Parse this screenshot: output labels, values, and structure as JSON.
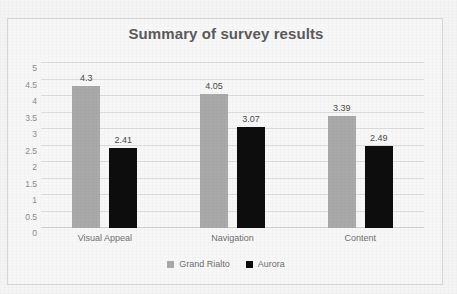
{
  "chart_data": {
    "type": "bar",
    "title": "Summary of survey results",
    "categories": [
      "Visual Appeal",
      "Navigation",
      "Content"
    ],
    "series": [
      {
        "name": "Grand Rialto",
        "color": "#a9a9a9",
        "values": [
          4.3,
          4.05,
          3.39
        ],
        "labels": [
          "4.3",
          "4.05",
          "3.39"
        ]
      },
      {
        "name": "Aurora",
        "color": "#0d0d0d",
        "values": [
          2.41,
          3.07,
          2.49
        ],
        "labels": [
          "2.41",
          "3.07",
          "2.49"
        ]
      }
    ],
    "xlabel": "",
    "ylabel": "",
    "ylim": [
      0,
      5
    ],
    "ytick_values": [
      0,
      0.5,
      1,
      1.5,
      2,
      2.5,
      3,
      3.5,
      4,
      4.5,
      5
    ],
    "ytick_labels": [
      "0",
      "0.5",
      "1",
      "1.5",
      "2",
      "2.5",
      "3",
      "3.5",
      "4",
      "4.5",
      "5"
    ],
    "grid": true,
    "legend_position": "bottom",
    "data_labels": true
  },
  "style": {
    "page_background": "#f4f4f4",
    "plot_background": "#f7f7f7",
    "border_color": "#d6d6d6",
    "gridline_color": "#dcdcdc",
    "title_color": "#5a5a5a",
    "tick_color": "#8b8b8b",
    "label_color": "#6f6f6f"
  }
}
